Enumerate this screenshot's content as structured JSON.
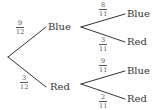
{
  "tree": {
    "level1": [
      {
        "outcome": "Blue",
        "probability": {
          "numerator": "9",
          "denominator": "12"
        }
      },
      {
        "outcome": "Red",
        "probability": {
          "numerator": "3",
          "denominator": "12"
        }
      }
    ],
    "level2": {
      "after_blue": [
        {
          "outcome": "Blue",
          "probability": {
            "numerator": "8",
            "denominator": "11"
          }
        },
        {
          "outcome": "Red",
          "probability": {
            "numerator": "3",
            "denominator": "11"
          }
        }
      ],
      "after_red": [
        {
          "outcome": "Blue",
          "probability": {
            "numerator": "9",
            "denominator": "11"
          }
        },
        {
          "outcome": "Red",
          "probability": {
            "numerator": "2",
            "denominator": "11"
          }
        }
      ]
    }
  },
  "colors": {
    "line": "#333333",
    "text": "#333333",
    "fraction": "#555555",
    "background": "#ffffff"
  }
}
